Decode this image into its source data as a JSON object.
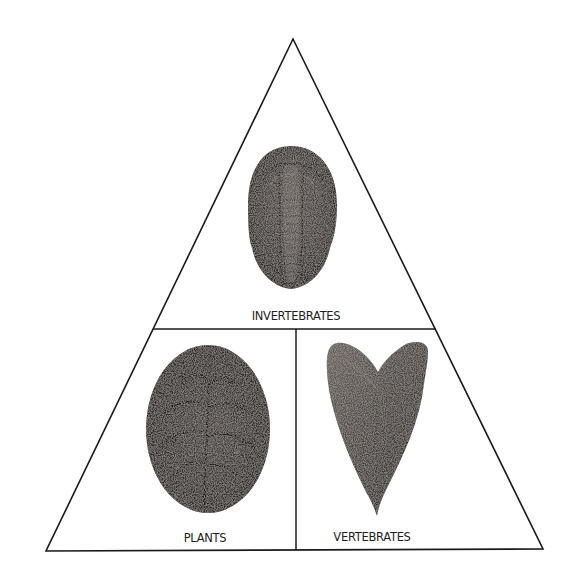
{
  "diagram": {
    "title": "",
    "type": "triangle-classification",
    "colors": {
      "background": "#ffffff",
      "outline": "#1a1a1a",
      "fossil_dark": "#2b2826",
      "fossil_mid": "#5a5450",
      "fossil_light": "#8a837d"
    },
    "sections": [
      {
        "id": "top",
        "label": "INVERTEBRATES",
        "image": "trilobite-fossil",
        "position": "top"
      },
      {
        "id": "bottom-left",
        "label": "PLANTS",
        "image": "fern-leaf-fossil",
        "position": "bottom-left"
      },
      {
        "id": "bottom-right",
        "label": "VERTEBRATES",
        "image": "shark-tooth-fossil",
        "position": "bottom-right"
      }
    ]
  }
}
